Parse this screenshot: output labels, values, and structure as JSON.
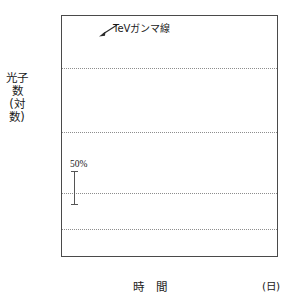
{
  "figure": {
    "ytitle": "光子数(対数)",
    "xtitle": "時 間",
    "xunit": "(日)"
  },
  "annotations": {
    "tev_label": "TeVガンマ線",
    "percent_label": "50%"
  },
  "axes": {
    "y_ticks": [
      "50.0",
      "10.0",
      "5.0",
      "1.0",
      "0.5"
    ],
    "x_ticks": [
      "50924",
      "50926",
      "50928",
      "50930",
      "50932",
      "50934"
    ]
  },
  "chart_data": {
    "type": "scatter",
    "title": "",
    "xlabel": "時 間 (日)",
    "ylabel": "光子数(対数)",
    "yscale": "log",
    "ylim": [
      0.22,
      70
    ],
    "xlim": [
      50922.4,
      50934.3
    ],
    "grid": "horizontal-dotted",
    "legend": "none",
    "y_tick_values": [
      50.0,
      10.0,
      5.0,
      1.0,
      0.5
    ],
    "x_tick_values": [
      50924,
      50926,
      50928,
      50930,
      50932,
      50934
    ],
    "reference_lines": [
      20.0,
      4.3,
      1.0,
      0.42
    ],
    "annotations": [
      {
        "text": "TeVガンマ線",
        "x": 50925.3,
        "y": 42.0,
        "arrow_to": {
          "x": 50924.25,
          "y": 36.0
        }
      },
      {
        "text": "50%",
        "x": 50923.0,
        "y": 1.95,
        "type": "errorbar-scale"
      }
    ],
    "series": [
      {
        "name": "TeVガンマ線",
        "marker": "open-circle-with-errorbar",
        "points": [
          {
            "x": 50922.95,
            "y": 11.2,
            "yerr_lo": 3.4,
            "yerr_hi": 3.6
          },
          {
            "x": 50923.85,
            "y": 13.0,
            "yerr_lo": 3.6,
            "yerr_hi": 4.2
          },
          {
            "x": 50924.18,
            "y": 20.5,
            "yerr_lo": 3.6,
            "yerr_hi": 4.0
          },
          {
            "x": 50924.22,
            "y": 26.5,
            "yerr_lo": 4.0,
            "yerr_hi": 4.5
          },
          {
            "x": 50924.26,
            "y": 31.0,
            "yerr_lo": 4.5,
            "yerr_hi": 5.0
          },
          {
            "x": 50924.3,
            "y": 36.0,
            "yerr_lo": 5.0,
            "yerr_hi": 6.0
          },
          {
            "x": 50924.34,
            "y": 13.5,
            "yerr_lo": 4.0,
            "yerr_hi": 4.2
          },
          {
            "x": 50924.85,
            "y": 12.8,
            "yerr_lo": 3.5,
            "yerr_hi": 3.8
          },
          {
            "x": 50925.02,
            "y": 20.2,
            "yerr_lo": 3.2,
            "yerr_hi": 3.4
          },
          {
            "x": 50925.12,
            "y": 9.5,
            "yerr_lo": 3.0,
            "yerr_hi": 3.6
          },
          {
            "x": 50925.95,
            "y": 12.5,
            "yerr_lo": 3.4,
            "yerr_hi": 3.6
          },
          {
            "x": 50926.05,
            "y": 27.0,
            "yerr_lo": 3.6,
            "yerr_hi": 3.8
          },
          {
            "x": 50926.95,
            "y": 14.5,
            "yerr_lo": 4.4,
            "yerr_hi": 4.8
          },
          {
            "x": 50927.18,
            "y": 9.0,
            "yerr_lo": 3.0,
            "yerr_hi": 3.4
          },
          {
            "x": 50927.22,
            "y": 13.0,
            "yerr_lo": 4.8,
            "yerr_hi": 5.2
          },
          {
            "x": 50927.85,
            "y": 27.5,
            "yerr_lo": 3.8,
            "yerr_hi": 4.2
          },
          {
            "x": 50928.12,
            "y": 10.5,
            "yerr_lo": 2.6,
            "yerr_hi": 3.0
          },
          {
            "x": 50929.05,
            "y": 20.5,
            "yerr_lo": 2.6,
            "yerr_hi": 2.8
          },
          {
            "x": 50929.95,
            "y": 17.5,
            "yerr_lo": 2.4,
            "yerr_hi": 2.6
          },
          {
            "x": 50930.05,
            "y": 33.0,
            "yerr_lo": 3.0,
            "yerr_hi": 3.4
          },
          {
            "x": 50930.95,
            "y": 40.0,
            "yerr_lo": 3.2,
            "yerr_hi": 3.4
          },
          {
            "x": 50931.05,
            "y": 20.5,
            "yerr_lo": 5.2,
            "yerr_hi": 5.6
          },
          {
            "x": 50931.12,
            "y": 17.5,
            "yerr_lo": 4.2,
            "yerr_hi": 4.6
          },
          {
            "x": 50932.02,
            "y": 11.5,
            "yerr_lo": 3.2,
            "yerr_hi": 3.8
          },
          {
            "x": 50932.22,
            "y": 26.0,
            "yerr_lo": 3.0,
            "yerr_hi": 3.2
          },
          {
            "x": 50932.3,
            "y": 15.5,
            "yerr_lo": 3.2,
            "yerr_hi": 3.4
          },
          {
            "x": 50933.15,
            "y": 20.5,
            "yerr_lo": 2.8,
            "yerr_hi": 3.0
          }
        ]
      },
      {
        "name": "X線（硬）",
        "marker": "dot",
        "points": [
          {
            "x": 50922.95,
            "y": 4.4
          },
          {
            "x": 50924.12,
            "y": 4.3
          },
          {
            "x": 50925.1,
            "y": 2.95
          },
          {
            "x": 50925.25,
            "y": 2.1
          },
          {
            "x": 50926.0,
            "y": 2.95
          },
          {
            "x": 50926.55,
            "y": 2.3
          },
          {
            "x": 50926.95,
            "y": 1.85
          },
          {
            "x": 50927.05,
            "y": 2.05
          },
          {
            "x": 50927.12,
            "y": 2.3
          },
          {
            "x": 50927.2,
            "y": 2.55
          },
          {
            "x": 50927.28,
            "y": 2.9
          },
          {
            "x": 50927.45,
            "y": 1.85
          },
          {
            "x": 50927.55,
            "y": 2.1
          },
          {
            "x": 50927.62,
            "y": 2.45
          },
          {
            "x": 50927.7,
            "y": 2.8
          },
          {
            "x": 50927.95,
            "y": 3.1
          },
          {
            "x": 50928.05,
            "y": 2.55
          },
          {
            "x": 50928.12,
            "y": 2.2
          },
          {
            "x": 50928.85,
            "y": 4.0
          },
          {
            "x": 50928.95,
            "y": 4.25
          },
          {
            "x": 50929.05,
            "y": 4.45
          },
          {
            "x": 50929.85,
            "y": 4.05
          },
          {
            "x": 50929.95,
            "y": 4.4
          },
          {
            "x": 50930.05,
            "y": 4.7
          },
          {
            "x": 50930.15,
            "y": 3.85
          },
          {
            "x": 50930.85,
            "y": 4.35
          },
          {
            "x": 50930.95,
            "y": 4.6
          },
          {
            "x": 50931.05,
            "y": 5.1
          },
          {
            "x": 50931.15,
            "y": 5.3
          },
          {
            "x": 50931.85,
            "y": 4.9
          },
          {
            "x": 50931.95,
            "y": 5.4
          },
          {
            "x": 50932.05,
            "y": 6.1
          },
          {
            "x": 50932.12,
            "y": 6.6
          },
          {
            "x": 50932.85,
            "y": 5.8
          },
          {
            "x": 50932.95,
            "y": 6.6
          },
          {
            "x": 50933.05,
            "y": 7.2
          },
          {
            "x": 50933.35,
            "y": 5.6
          },
          {
            "x": 50933.45,
            "y": 5.2
          },
          {
            "x": 50933.55,
            "y": 4.6
          }
        ]
      },
      {
        "name": "X線（軟）",
        "marker": "dot",
        "points": [
          {
            "x": 50923.9,
            "y": 1.4
          },
          {
            "x": 50923.98,
            "y": 1.3
          },
          {
            "x": 50924.08,
            "y": 1.18
          },
          {
            "x": 50924.18,
            "y": 1.05
          },
          {
            "x": 50924.28,
            "y": 1.12
          },
          {
            "x": 50924.38,
            "y": 1.02
          },
          {
            "x": 50924.5,
            "y": 0.97
          },
          {
            "x": 50924.62,
            "y": 0.92
          },
          {
            "x": 50924.75,
            "y": 0.86
          },
          {
            "x": 50924.88,
            "y": 0.82
          },
          {
            "x": 50925.0,
            "y": 0.79
          },
          {
            "x": 50925.1,
            "y": 0.76
          },
          {
            "x": 50925.18,
            "y": 0.72
          },
          {
            "x": 50925.95,
            "y": 0.84
          },
          {
            "x": 50926.1,
            "y": 0.82
          },
          {
            "x": 50926.25,
            "y": 0.79
          },
          {
            "x": 50926.4,
            "y": 0.76
          },
          {
            "x": 50926.55,
            "y": 0.73
          },
          {
            "x": 50926.7,
            "y": 0.7
          },
          {
            "x": 50926.85,
            "y": 0.66
          },
          {
            "x": 50927.0,
            "y": 0.62
          },
          {
            "x": 50927.12,
            "y": 0.6
          },
          {
            "x": 50927.25,
            "y": 0.63
          },
          {
            "x": 50927.4,
            "y": 0.72
          },
          {
            "x": 50927.55,
            "y": 0.82
          },
          {
            "x": 50927.7,
            "y": 0.92
          },
          {
            "x": 50927.85,
            "y": 1.05
          },
          {
            "x": 50928.0,
            "y": 0.98
          },
          {
            "x": 50928.15,
            "y": 0.92
          },
          {
            "x": 50928.35,
            "y": 0.95
          },
          {
            "x": 50928.55,
            "y": 1.02
          },
          {
            "x": 50928.75,
            "y": 1.06
          },
          {
            "x": 50928.95,
            "y": 1.1
          },
          {
            "x": 50929.15,
            "y": 1.18
          },
          {
            "x": 50929.35,
            "y": 1.22
          },
          {
            "x": 50929.55,
            "y": 1.15
          },
          {
            "x": 50929.75,
            "y": 1.12
          },
          {
            "x": 50929.95,
            "y": 1.2
          },
          {
            "x": 50930.15,
            "y": 1.26
          },
          {
            "x": 50930.35,
            "y": 1.18
          },
          {
            "x": 50930.55,
            "y": 1.1
          },
          {
            "x": 50930.75,
            "y": 1.14
          },
          {
            "x": 50930.95,
            "y": 1.22
          },
          {
            "x": 50931.15,
            "y": 1.3
          },
          {
            "x": 50931.35,
            "y": 1.22
          },
          {
            "x": 50931.55,
            "y": 1.05
          },
          {
            "x": 50931.75,
            "y": 0.95
          },
          {
            "x": 50931.95,
            "y": 0.98
          },
          {
            "x": 50932.15,
            "y": 1.08
          },
          {
            "x": 50932.35,
            "y": 1.0
          },
          {
            "x": 50932.55,
            "y": 0.96
          },
          {
            "x": 50932.85,
            "y": 1.3
          },
          {
            "x": 50933.0,
            "y": 1.22
          },
          {
            "x": 50933.15,
            "y": 1.1
          },
          {
            "x": 50933.3,
            "y": 0.95
          },
          {
            "x": 50933.45,
            "y": 1.05
          },
          {
            "x": 50933.6,
            "y": 1.15
          }
        ]
      },
      {
        "name": "低エネルギー",
        "marker": "dot",
        "points": [
          {
            "x": 50922.7,
            "y": 0.415
          },
          {
            "x": 50922.9,
            "y": 0.405
          },
          {
            "x": 50923.05,
            "y": 0.43
          },
          {
            "x": 50923.2,
            "y": 0.42
          },
          {
            "x": 50923.35,
            "y": 0.44
          },
          {
            "x": 50923.5,
            "y": 0.45
          },
          {
            "x": 50923.65,
            "y": 0.435
          },
          {
            "x": 50923.8,
            "y": 0.415
          },
          {
            "x": 50923.95,
            "y": 0.375
          },
          {
            "x": 50924.1,
            "y": 0.425
          },
          {
            "x": 50924.3,
            "y": 0.445
          },
          {
            "x": 50924.5,
            "y": 0.42
          },
          {
            "x": 50924.7,
            "y": 0.4
          },
          {
            "x": 50924.9,
            "y": 0.41
          },
          {
            "x": 50925.1,
            "y": 0.425
          },
          {
            "x": 50925.25,
            "y": 0.305
          },
          {
            "x": 50925.45,
            "y": 0.395
          },
          {
            "x": 50925.65,
            "y": 0.405
          },
          {
            "x": 50925.85,
            "y": 0.415
          },
          {
            "x": 50926.05,
            "y": 0.43
          },
          {
            "x": 50926.25,
            "y": 0.425
          },
          {
            "x": 50926.45,
            "y": 0.42
          },
          {
            "x": 50926.65,
            "y": 0.405
          },
          {
            "x": 50926.85,
            "y": 0.39
          },
          {
            "x": 50927.05,
            "y": 0.355
          },
          {
            "x": 50927.25,
            "y": 0.345
          },
          {
            "x": 50927.45,
            "y": 0.35
          },
          {
            "x": 50927.65,
            "y": 0.365
          },
          {
            "x": 50927.85,
            "y": 0.385
          },
          {
            "x": 50928.05,
            "y": 0.405
          },
          {
            "x": 50928.25,
            "y": 0.415
          },
          {
            "x": 50928.45,
            "y": 0.4
          },
          {
            "x": 50928.65,
            "y": 0.41
          },
          {
            "x": 50928.85,
            "y": 0.43
          },
          {
            "x": 50929.05,
            "y": 0.42
          },
          {
            "x": 50929.25,
            "y": 0.4
          },
          {
            "x": 50929.45,
            "y": 0.425
          },
          {
            "x": 50929.65,
            "y": 0.445
          },
          {
            "x": 50929.85,
            "y": 0.43
          },
          {
            "x": 50930.05,
            "y": 0.415
          },
          {
            "x": 50930.25,
            "y": 0.455
          },
          {
            "x": 50930.45,
            "y": 0.47
          },
          {
            "x": 50930.6,
            "y": 0.49
          },
          {
            "x": 50930.75,
            "y": 0.465
          },
          {
            "x": 50930.9,
            "y": 0.445
          },
          {
            "x": 50931.1,
            "y": 0.46
          },
          {
            "x": 50931.3,
            "y": 0.44
          },
          {
            "x": 50931.5,
            "y": 0.425
          },
          {
            "x": 50931.7,
            "y": 0.4
          },
          {
            "x": 50931.9,
            "y": 0.385
          },
          {
            "x": 50932.1,
            "y": 0.415
          },
          {
            "x": 50932.3,
            "y": 0.43
          },
          {
            "x": 50932.5,
            "y": 0.42
          },
          {
            "x": 50932.7,
            "y": 0.4
          },
          {
            "x": 50932.9,
            "y": 0.415
          },
          {
            "x": 50933.1,
            "y": 0.44
          },
          {
            "x": 50933.3,
            "y": 0.465
          },
          {
            "x": 50933.5,
            "y": 0.49
          },
          {
            "x": 50933.7,
            "y": 0.47
          }
        ]
      }
    ]
  }
}
